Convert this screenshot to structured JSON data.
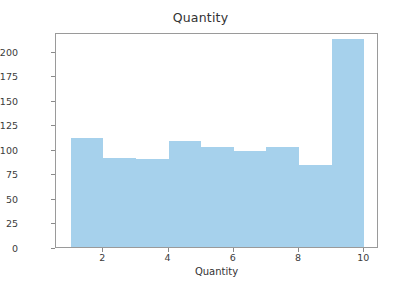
{
  "chart_data": {
    "type": "bar",
    "title": "Quantity",
    "xlabel": "Quantity",
    "ylabel": "",
    "categories": [
      "1-2",
      "2-3",
      "3-4",
      "4-5",
      "5-6",
      "6-7",
      "7-8",
      "8-9",
      "9-10"
    ],
    "bin_edges": [
      1,
      2,
      3,
      4,
      5,
      6,
      7,
      8,
      9,
      10
    ],
    "values": [
      111,
      91,
      90,
      108,
      102,
      98,
      102,
      84,
      212
    ],
    "xlim": [
      0.55,
      10.45
    ],
    "ylim": [
      0,
      219
    ],
    "xticks": [
      2,
      4,
      6,
      8,
      10
    ],
    "xtick_labels": [
      "2",
      "4",
      "6",
      "8",
      "10"
    ],
    "yticks": [
      0,
      25,
      50,
      75,
      100,
      125,
      150,
      175,
      200
    ],
    "ytick_labels": [
      "0",
      "25",
      "50",
      "75",
      "100",
      "125",
      "150",
      "175",
      "200"
    ],
    "grid": false,
    "legend": null,
    "bar_color": "#a6d1ec",
    "background_color": "#ffffff",
    "axis_color": "#9a9a9a",
    "text_color": "#333333"
  }
}
